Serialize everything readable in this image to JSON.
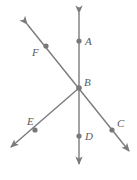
{
  "figure": {
    "type": "geometry-diagram",
    "width": 137,
    "height": 180,
    "background_color": "#ffffff",
    "stroke_color": "#7b7b7f",
    "point_color": "#78787c",
    "label_color": "#5a5a5c",
    "stroke_width": 1.4,
    "point_radius": 2.6,
    "points": [
      {
        "id": "A",
        "label": "A",
        "x": 79,
        "y": 41,
        "label_x": 85,
        "label_y": 36
      },
      {
        "id": "B",
        "label": "B",
        "x": 79,
        "y": 88,
        "label_x": 84,
        "label_y": 77
      },
      {
        "id": "C",
        "label": "C",
        "x": 112,
        "y": 130,
        "label_x": 117,
        "label_y": 118
      },
      {
        "id": "D",
        "label": "D",
        "x": 79,
        "y": 136,
        "label_x": 85,
        "label_y": 131
      },
      {
        "id": "E",
        "label": "E",
        "x": 35,
        "y": 130,
        "label_x": 27,
        "label_y": 116
      },
      {
        "id": "F",
        "label": "F",
        "x": 46,
        "y": 46,
        "label_x": 32,
        "label_y": 47
      }
    ],
    "lines": [
      {
        "id": "vertical-line-AD",
        "name": "line-through-A-B-D",
        "x1": 79,
        "y1": 13,
        "x2": 79,
        "y2": 164,
        "arrow_start": true,
        "arrow_end": true
      },
      {
        "id": "diagonal-line-FC",
        "name": "line-through-F-B-C",
        "x1": 27,
        "y1": 24,
        "x2": 129,
        "y2": 151,
        "arrow_start": true,
        "arrow_end": true
      },
      {
        "id": "ray-BE",
        "name": "ray-from-B-through-E",
        "x1": 79,
        "y1": 88,
        "x2": 11,
        "y2": 147,
        "arrow_start": false,
        "arrow_end": true
      }
    ]
  }
}
